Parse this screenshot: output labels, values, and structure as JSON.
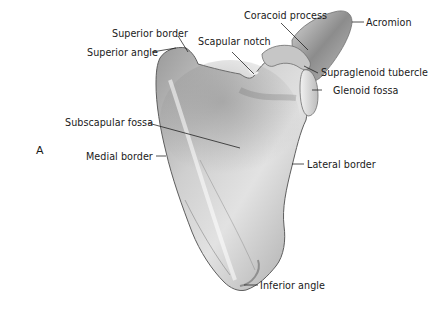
{
  "figure": {
    "letter": "A"
  },
  "labels": {
    "coracoid_process": "Coracoid process",
    "acromion": "Acromion",
    "superior_border": "Superior border",
    "scapular_notch": "Scapular notch",
    "superior_angle": "Superior angle",
    "supraglenoid_tubercle": "Supraglenoid tubercle",
    "glenoid_fossa": "Glenoid fossa",
    "subscapular_fossa": "Subscapular fossa",
    "medial_border": "Medial border",
    "lateral_border": "Lateral border",
    "inferior_angle": "Inferior angle"
  },
  "colors": {
    "background": "#ffffff",
    "bone_light": "#e6e6e6",
    "bone_mid": "#b5b5b5",
    "bone_dark": "#6e6e6e",
    "leader_line": "#1a1a1a",
    "text": "#1a1a1a"
  }
}
